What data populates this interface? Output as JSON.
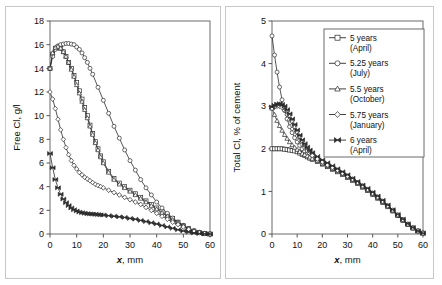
{
  "figure": {
    "panels": [
      "left",
      "right"
    ]
  },
  "chart_data": [
    {
      "type": "line",
      "panel": "left",
      "title": "",
      "xlabel": "x, mm",
      "xlabel_italic": "x",
      "xlabel_rest": ", mm",
      "ylabel": "Free Cl, g/l",
      "xlim": [
        0,
        60
      ],
      "ylim": [
        0,
        18
      ],
      "xticks": [
        0,
        10,
        20,
        30,
        40,
        50,
        60
      ],
      "yticks": [
        0,
        2,
        4,
        6,
        8,
        10,
        12,
        14,
        16,
        18
      ],
      "grid": false,
      "legend": false,
      "series": [
        {
          "name": "5 years (April)",
          "marker": "square",
          "x": [
            0,
            1,
            2,
            3,
            4,
            5,
            6,
            7,
            8,
            9,
            10,
            11,
            12,
            13,
            14,
            15,
            16,
            17,
            18,
            19,
            20,
            22,
            24,
            26,
            28,
            30,
            32,
            34,
            36,
            38,
            40,
            42,
            44,
            46,
            48,
            50,
            52,
            54,
            56,
            58,
            60
          ],
          "values": [
            14.0,
            15.2,
            15.7,
            15.8,
            15.7,
            15.4,
            15.0,
            14.5,
            14.0,
            13.4,
            12.8,
            12.1,
            11.4,
            10.7,
            10.0,
            9.2,
            8.5,
            7.8,
            7.2,
            6.6,
            6.1,
            5.3,
            4.7,
            4.3,
            4.0,
            3.7,
            3.4,
            3.1,
            2.8,
            2.5,
            2.2,
            1.9,
            1.6,
            1.3,
            1.0,
            0.7,
            0.45,
            0.25,
            0.12,
            0.05,
            0.0
          ]
        },
        {
          "name": "5.25 years (July)",
          "marker": "circle",
          "x": [
            0,
            1,
            2,
            3,
            4,
            5,
            6,
            7,
            8,
            9,
            10,
            11,
            12,
            13,
            14,
            15,
            16,
            18,
            20,
            22,
            24,
            26,
            28,
            30,
            32,
            34,
            36,
            38,
            40,
            42,
            44,
            46,
            48,
            50,
            52,
            54,
            56,
            58,
            60
          ],
          "values": [
            14.0,
            15.0,
            15.6,
            15.9,
            16.0,
            16.05,
            16.1,
            16.1,
            16.05,
            16.0,
            15.8,
            15.6,
            15.3,
            14.9,
            14.5,
            14.0,
            13.5,
            12.4,
            11.3,
            10.2,
            9.1,
            8.1,
            7.1,
            6.2,
            5.4,
            4.6,
            3.9,
            3.3,
            2.7,
            2.2,
            1.75,
            1.35,
            1.0,
            0.7,
            0.45,
            0.28,
            0.15,
            0.06,
            0.0
          ]
        },
        {
          "name": "5.5 years (October)",
          "marker": "triangle",
          "x": [
            0,
            1,
            2,
            3,
            4,
            5,
            6,
            7,
            8,
            9,
            10,
            11,
            12,
            13,
            14,
            15,
            16,
            17,
            18,
            19,
            20,
            22,
            24,
            26,
            28,
            30,
            32,
            34,
            36,
            38,
            40,
            42,
            44,
            46,
            48,
            50,
            52,
            54,
            56,
            58,
            60
          ],
          "values": [
            14.0,
            15.3,
            15.75,
            15.85,
            15.7,
            15.4,
            15.0,
            14.5,
            13.9,
            13.3,
            12.6,
            11.9,
            11.2,
            10.5,
            9.8,
            9.1,
            8.4,
            7.7,
            7.1,
            6.5,
            6.0,
            5.2,
            4.6,
            4.2,
            3.9,
            3.6,
            3.3,
            3.0,
            2.7,
            2.4,
            2.1,
            1.8,
            1.5,
            1.2,
            0.95,
            0.7,
            0.45,
            0.25,
            0.12,
            0.05,
            0.0
          ]
        },
        {
          "name": "5.75 years (January)",
          "marker": "diamond",
          "x": [
            0,
            1,
            2,
            3,
            4,
            5,
            6,
            7,
            8,
            9,
            10,
            11,
            12,
            13,
            14,
            15,
            16,
            17,
            18,
            19,
            20,
            22,
            24,
            26,
            28,
            30,
            32,
            34,
            36,
            38,
            40,
            42,
            44,
            46,
            48,
            50,
            52,
            54,
            56,
            58,
            60
          ],
          "values": [
            12.0,
            11.4,
            10.6,
            9.7,
            8.8,
            8.0,
            7.3,
            6.7,
            6.2,
            5.8,
            5.5,
            5.2,
            5.0,
            4.8,
            4.65,
            4.5,
            4.35,
            4.2,
            4.1,
            4.0,
            3.9,
            3.7,
            3.5,
            3.3,
            3.1,
            2.9,
            2.7,
            2.5,
            2.25,
            2.0,
            1.75,
            1.5,
            1.25,
            1.0,
            0.8,
            0.6,
            0.4,
            0.22,
            0.1,
            0.04,
            0.0
          ]
        },
        {
          "name": "6 years (April)",
          "marker": "cross",
          "x": [
            0,
            1,
            2,
            3,
            4,
            5,
            6,
            7,
            8,
            9,
            10,
            11,
            12,
            13,
            14,
            15,
            16,
            17,
            18,
            19,
            20,
            22,
            24,
            26,
            28,
            30,
            32,
            34,
            36,
            38,
            40,
            42,
            44,
            46,
            48,
            50,
            52,
            54,
            56,
            58,
            60
          ],
          "values": [
            6.8,
            5.6,
            4.6,
            3.9,
            3.35,
            2.95,
            2.65,
            2.4,
            2.2,
            2.05,
            1.95,
            1.85,
            1.8,
            1.75,
            1.72,
            1.7,
            1.68,
            1.66,
            1.64,
            1.62,
            1.6,
            1.55,
            1.5,
            1.45,
            1.4,
            1.32,
            1.25,
            1.15,
            1.05,
            0.95,
            0.85,
            0.72,
            0.6,
            0.48,
            0.36,
            0.26,
            0.16,
            0.09,
            0.04,
            0.01,
            0.0
          ]
        }
      ]
    },
    {
      "type": "line",
      "panel": "right",
      "title": "",
      "xlabel": "x, mm",
      "xlabel_italic": "x",
      "xlabel_rest": ", mm",
      "ylabel": "Total Cl, % of cement",
      "xlim": [
        0,
        60
      ],
      "ylim": [
        0,
        5
      ],
      "xticks": [
        0,
        10,
        20,
        30,
        40,
        50,
        60
      ],
      "yticks": [
        0,
        1,
        2,
        3,
        4,
        5
      ],
      "grid": false,
      "legend": true,
      "legend_position": "top-right",
      "series": [
        {
          "name": "5 years (April)",
          "marker": "square",
          "x": [
            0,
            1,
            2,
            3,
            4,
            5,
            6,
            7,
            8,
            9,
            10,
            11,
            12,
            13,
            14,
            15,
            16,
            18,
            20,
            22,
            24,
            26,
            28,
            30,
            32,
            34,
            36,
            38,
            40,
            42,
            44,
            46,
            48,
            50,
            52,
            54,
            56,
            58,
            60
          ],
          "values": [
            2.0,
            2.0,
            2.0,
            2.0,
            2.0,
            1.99,
            1.98,
            1.97,
            1.96,
            1.95,
            1.93,
            1.9,
            1.87,
            1.84,
            1.81,
            1.78,
            1.75,
            1.7,
            1.64,
            1.58,
            1.52,
            1.46,
            1.4,
            1.33,
            1.26,
            1.19,
            1.1,
            1.02,
            0.93,
            0.84,
            0.74,
            0.64,
            0.54,
            0.43,
            0.32,
            0.22,
            0.14,
            0.07,
            0.02
          ]
        },
        {
          "name": "5.25 years (July)",
          "marker": "circle",
          "x": [
            0,
            1,
            2,
            3,
            4,
            5,
            6,
            7,
            8,
            9,
            10,
            11,
            12,
            13,
            14,
            15,
            16,
            18,
            20,
            22,
            24,
            26,
            28,
            30,
            32,
            34,
            36,
            38,
            40,
            42,
            44,
            46,
            48,
            50,
            52,
            54,
            56,
            58,
            60
          ],
          "values": [
            4.65,
            4.2,
            3.8,
            3.45,
            3.15,
            2.9,
            2.7,
            2.52,
            2.38,
            2.26,
            2.16,
            2.08,
            2.0,
            1.94,
            1.88,
            1.83,
            1.78,
            1.71,
            1.65,
            1.59,
            1.53,
            1.47,
            1.41,
            1.34,
            1.27,
            1.2,
            1.11,
            1.03,
            0.94,
            0.85,
            0.75,
            0.65,
            0.55,
            0.44,
            0.33,
            0.23,
            0.14,
            0.07,
            0.02
          ]
        },
        {
          "name": "5.5 years (October)",
          "marker": "triangle",
          "x": [
            0,
            1,
            2,
            3,
            4,
            5,
            6,
            7,
            8,
            9,
            10,
            11,
            12,
            13,
            14,
            15,
            16,
            18,
            20,
            22,
            24,
            26,
            28,
            30,
            32,
            34,
            36,
            38,
            40,
            42,
            44,
            46,
            48,
            50,
            52,
            54,
            56,
            58,
            60
          ],
          "values": [
            2.95,
            2.8,
            2.66,
            2.54,
            2.43,
            2.33,
            2.24,
            2.16,
            2.09,
            2.03,
            1.98,
            1.93,
            1.89,
            1.86,
            1.83,
            1.8,
            1.77,
            1.72,
            1.66,
            1.6,
            1.54,
            1.48,
            1.42,
            1.35,
            1.28,
            1.2,
            1.12,
            1.04,
            0.95,
            0.86,
            0.76,
            0.66,
            0.55,
            0.44,
            0.33,
            0.23,
            0.14,
            0.07,
            0.02
          ]
        },
        {
          "name": "5.75 years (January)",
          "marker": "diamond",
          "x": [
            0,
            1,
            2,
            3,
            4,
            5,
            6,
            7,
            8,
            9,
            10,
            11,
            12,
            13,
            14,
            15,
            16,
            18,
            20,
            22,
            24,
            26,
            28,
            30,
            32,
            34,
            36,
            38,
            40,
            42,
            44,
            46,
            48,
            50,
            52,
            54,
            56,
            58,
            60
          ],
          "values": [
            2.95,
            2.98,
            3.0,
            3.0,
            2.97,
            2.9,
            2.8,
            2.68,
            2.55,
            2.42,
            2.3,
            2.2,
            2.1,
            2.02,
            1.95,
            1.89,
            1.84,
            1.76,
            1.69,
            1.62,
            1.56,
            1.5,
            1.43,
            1.36,
            1.29,
            1.21,
            1.13,
            1.05,
            0.96,
            0.87,
            0.77,
            0.66,
            0.56,
            0.45,
            0.34,
            0.23,
            0.14,
            0.07,
            0.02
          ]
        },
        {
          "name": "6 years (April)",
          "marker": "cross",
          "x": [
            0,
            1,
            2,
            3,
            4,
            5,
            6,
            7,
            8,
            9,
            10,
            11,
            12,
            13,
            14,
            15,
            16,
            18,
            20,
            22,
            24,
            26,
            28,
            30,
            32,
            34,
            36,
            38,
            40,
            42,
            44,
            46,
            48,
            50,
            52,
            54,
            56,
            58,
            60
          ],
          "values": [
            2.98,
            3.02,
            3.05,
            3.06,
            3.04,
            3.0,
            2.92,
            2.82,
            2.7,
            2.57,
            2.44,
            2.32,
            2.21,
            2.12,
            2.04,
            1.97,
            1.91,
            1.82,
            1.74,
            1.67,
            1.6,
            1.53,
            1.46,
            1.39,
            1.31,
            1.23,
            1.15,
            1.07,
            0.98,
            0.89,
            0.79,
            0.68,
            0.57,
            0.46,
            0.35,
            0.24,
            0.15,
            0.07,
            0.02
          ]
        }
      ]
    }
  ],
  "legend": {
    "entries": [
      {
        "marker": "square",
        "label_line1": "5 years",
        "label_line2": "(April)"
      },
      {
        "marker": "circle",
        "label_line1": "5.25 years",
        "label_line2": "(July)"
      },
      {
        "marker": "triangle",
        "label_line1": "5.5 years",
        "label_line2": "(October)"
      },
      {
        "marker": "diamond",
        "label_line1": "5.75 years",
        "label_line2": "(January)"
      },
      {
        "marker": "cross",
        "label_line1": "6 years",
        "label_line2": "(April)"
      }
    ]
  },
  "colors": {
    "line": "#2b2b2b",
    "marker_face": "#ffffff",
    "frame": "#6b6b6b",
    "panel_border": "#c8c8c8",
    "background": "#ffffff"
  }
}
